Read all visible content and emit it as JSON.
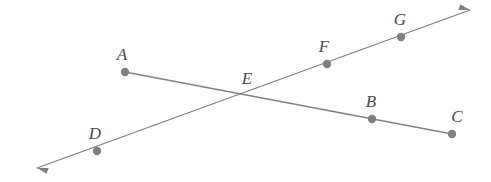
{
  "diagram": {
    "type": "geometry-line-diagram",
    "background_color": "#ffffff",
    "line_color": "#808080",
    "dot_color": "#808080",
    "label_color": "#4a4a4a",
    "line_width": 1.3,
    "dot_radius": 4.2,
    "points": [
      {
        "id": "A",
        "label": "A",
        "x": 125,
        "y": 72,
        "label_x": 122,
        "label_y": 60,
        "has_dot": true
      },
      {
        "id": "B",
        "label": "B",
        "x": 372,
        "y": 119,
        "label_x": 371,
        "label_y": 107,
        "has_dot": true
      },
      {
        "id": "C",
        "label": "C",
        "x": 452,
        "y": 134,
        "label_x": 457,
        "label_y": 122,
        "has_dot": true
      },
      {
        "id": "D",
        "label": "D",
        "x": 97,
        "y": 151,
        "label_x": 95,
        "label_y": 139,
        "has_dot": true
      },
      {
        "id": "E",
        "label": "E",
        "x": 248,
        "y": 96,
        "label_x": 247,
        "label_y": 84,
        "has_dot": false
      },
      {
        "id": "F",
        "label": "F",
        "x": 327,
        "y": 64,
        "label_x": 324,
        "label_y": 52,
        "has_dot": true
      },
      {
        "id": "G",
        "label": "G",
        "x": 401,
        "y": 37,
        "label_x": 400,
        "label_y": 25,
        "has_dot": true
      }
    ],
    "lines": [
      {
        "id": "segment-AC",
        "name": "segment-a-c",
        "from": {
          "x": 125,
          "y": 72
        },
        "to": {
          "x": 452,
          "y": 134
        },
        "arrow_start": false,
        "arrow_end": false,
        "passes_through": [
          "A",
          "E",
          "B",
          "C"
        ]
      },
      {
        "id": "ray-DG",
        "name": "line-d-g",
        "from": {
          "x": 37,
          "y": 168
        },
        "to": {
          "x": 470,
          "y": 10
        },
        "arrow_start": true,
        "arrow_end": true,
        "passes_through": [
          "D",
          "E",
          "F",
          "G"
        ]
      }
    ],
    "arrowheads": [
      {
        "id": "arrow-bottom-left",
        "x": 37,
        "y": 168,
        "angle": 200
      },
      {
        "id": "arrow-top-right",
        "x": 470,
        "y": 10,
        "angle": 20
      }
    ]
  }
}
